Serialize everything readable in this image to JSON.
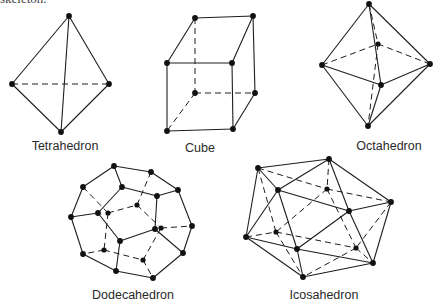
{
  "header": {
    "cut_text": "skeleton."
  },
  "figures": [
    {
      "name": "Tetrahedron",
      "label": "Tetrahedron",
      "label_pos": [
        65,
        139
      ],
      "vertices": {
        "top": [
          69,
          16
        ],
        "left": [
          12,
          84
        ],
        "right": [
          109,
          84
        ],
        "bottom": [
          61,
          132
        ]
      },
      "solid": [
        [
          "top",
          "left"
        ],
        [
          "top",
          "right"
        ],
        [
          "top",
          "bottom"
        ],
        [
          "left",
          "bottom"
        ],
        [
          "right",
          "bottom"
        ]
      ],
      "dashed": [
        [
          "left",
          "right"
        ]
      ],
      "hidden_vertices": []
    },
    {
      "name": "Cube",
      "label": "Cube",
      "label_pos": [
        200,
        141
      ],
      "vertices": {
        "btl": [
          195,
          18
        ],
        "btr": [
          253,
          16
        ],
        "ftl": [
          167,
          63
        ],
        "ftr": [
          232,
          63
        ],
        "bbl": [
          195,
          93
        ],
        "bbr": [
          255,
          93
        ],
        "fbl": [
          167,
          131
        ],
        "fbr": [
          233,
          129
        ]
      },
      "solid": [
        [
          "btl",
          "btr"
        ],
        [
          "btl",
          "ftl"
        ],
        [
          "btr",
          "ftr"
        ],
        [
          "ftl",
          "ftr"
        ],
        [
          "ftl",
          "fbl"
        ],
        [
          "ftr",
          "fbr"
        ],
        [
          "fbl",
          "fbr"
        ],
        [
          "btr",
          "bbr"
        ],
        [
          "bbr",
          "fbr"
        ]
      ],
      "dashed": [
        [
          "btl",
          "bbl"
        ],
        [
          "bbl",
          "bbr"
        ],
        [
          "bbl",
          "fbl"
        ]
      ],
      "hidden_vertices": []
    },
    {
      "name": "Octahedron",
      "label": "Octahedron",
      "label_pos": [
        389,
        139
      ],
      "vertices": {
        "top": [
          369,
          4
        ],
        "left": [
          322,
          65
        ],
        "right": [
          430,
          64
        ],
        "back": [
          378,
          44
        ],
        "front": [
          381,
          85
        ],
        "bottom": [
          368,
          126
        ]
      },
      "solid": [
        [
          "top",
          "left"
        ],
        [
          "top",
          "right"
        ],
        [
          "top",
          "front"
        ],
        [
          "left",
          "front"
        ],
        [
          "right",
          "front"
        ],
        [
          "left",
          "bottom"
        ],
        [
          "right",
          "bottom"
        ],
        [
          "front",
          "bottom"
        ]
      ],
      "dashed": [
        [
          "top",
          "back"
        ],
        [
          "left",
          "back"
        ],
        [
          "right",
          "back"
        ],
        [
          "back",
          "bottom"
        ]
      ],
      "hidden_vertices": [
        "back"
      ]
    },
    {
      "name": "Dodecahedron",
      "label": "Dodecahedron",
      "label_pos": [
        133,
        288
      ],
      "vertices": {
        "A": [
          114,
          166
        ],
        "B": [
          151,
          172
        ],
        "C": [
          83,
          187
        ],
        "D": [
          122,
          187
        ],
        "E": [
          178,
          190
        ],
        "F": [
          157,
          196
        ],
        "G": [
          71,
          217
        ],
        "H": [
          98,
          213
        ],
        "I": [
          137,
          205
        ],
        "J": [
          108,
          213
        ],
        "K": [
          155,
          229
        ],
        "L": [
          161,
          228
        ],
        "M": [
          192,
          226
        ],
        "N": [
          120,
          241
        ],
        "O": [
          104,
          250
        ],
        "P": [
          83,
          254
        ],
        "Q": [
          143,
          260
        ],
        "R": [
          183,
          253
        ],
        "S": [
          116,
          271
        ],
        "T": [
          153,
          278
        ]
      },
      "solid": [
        [
          "A",
          "B"
        ],
        [
          "A",
          "C"
        ],
        [
          "A",
          "D"
        ],
        [
          "B",
          "E"
        ],
        [
          "C",
          "G"
        ],
        [
          "D",
          "F"
        ],
        [
          "D",
          "H"
        ],
        [
          "E",
          "F"
        ],
        [
          "E",
          "M"
        ],
        [
          "F",
          "K"
        ],
        [
          "G",
          "H"
        ],
        [
          "G",
          "P"
        ],
        [
          "H",
          "N"
        ],
        [
          "K",
          "N"
        ],
        [
          "K",
          "R"
        ],
        [
          "M",
          "R"
        ],
        [
          "N",
          "S"
        ],
        [
          "P",
          "S"
        ],
        [
          "S",
          "T"
        ],
        [
          "T",
          "R"
        ]
      ],
      "dashed": [
        [
          "J",
          "I"
        ],
        [
          "I",
          "L"
        ],
        [
          "L",
          "M"
        ],
        [
          "J",
          "O"
        ],
        [
          "O",
          "P"
        ],
        [
          "O",
          "Q"
        ],
        [
          "Q",
          "T"
        ],
        [
          "Q",
          "L"
        ],
        [
          "I",
          "B"
        ],
        [
          "J",
          "C"
        ]
      ],
      "hidden_vertices": [
        "I",
        "J",
        "L",
        "O",
        "Q"
      ]
    },
    {
      "name": "Icosahedron",
      "label": "Icosahedron",
      "label_pos": [
        324,
        288
      ],
      "vertices": {
        "a": [
          258,
          168
        ],
        "b": [
          329,
          159
        ],
        "c": [
          278,
          190
        ],
        "d": [
          327,
          189
        ],
        "e": [
          391,
          202
        ],
        "f": [
          349,
          211
        ],
        "g": [
          246,
          237
        ],
        "h": [
          276,
          232
        ],
        "i": [
          297,
          249
        ],
        "j": [
          356,
          248
        ],
        "k": [
          373,
          263
        ],
        "l": [
          303,
          277
        ]
      },
      "solid": [
        [
          "a",
          "b"
        ],
        [
          "a",
          "c"
        ],
        [
          "a",
          "g"
        ],
        [
          "b",
          "c"
        ],
        [
          "b",
          "e"
        ],
        [
          "b",
          "f"
        ],
        [
          "c",
          "f"
        ],
        [
          "c",
          "g"
        ],
        [
          "c",
          "i"
        ],
        [
          "e",
          "f"
        ],
        [
          "e",
          "k"
        ],
        [
          "f",
          "i"
        ],
        [
          "f",
          "k"
        ],
        [
          "g",
          "i"
        ],
        [
          "g",
          "l"
        ],
        [
          "i",
          "l"
        ],
        [
          "i",
          "k"
        ],
        [
          "l",
          "k"
        ]
      ],
      "dashed": [
        [
          "a",
          "d"
        ],
        [
          "a",
          "h"
        ],
        [
          "b",
          "d"
        ],
        [
          "d",
          "e"
        ],
        [
          "d",
          "h"
        ],
        [
          "d",
          "j"
        ],
        [
          "e",
          "j"
        ],
        [
          "g",
          "h"
        ],
        [
          "h",
          "j"
        ],
        [
          "h",
          "l"
        ],
        [
          "j",
          "k"
        ],
        [
          "j",
          "l"
        ]
      ],
      "hidden_vertices": [
        "d",
        "h",
        "j"
      ]
    }
  ]
}
